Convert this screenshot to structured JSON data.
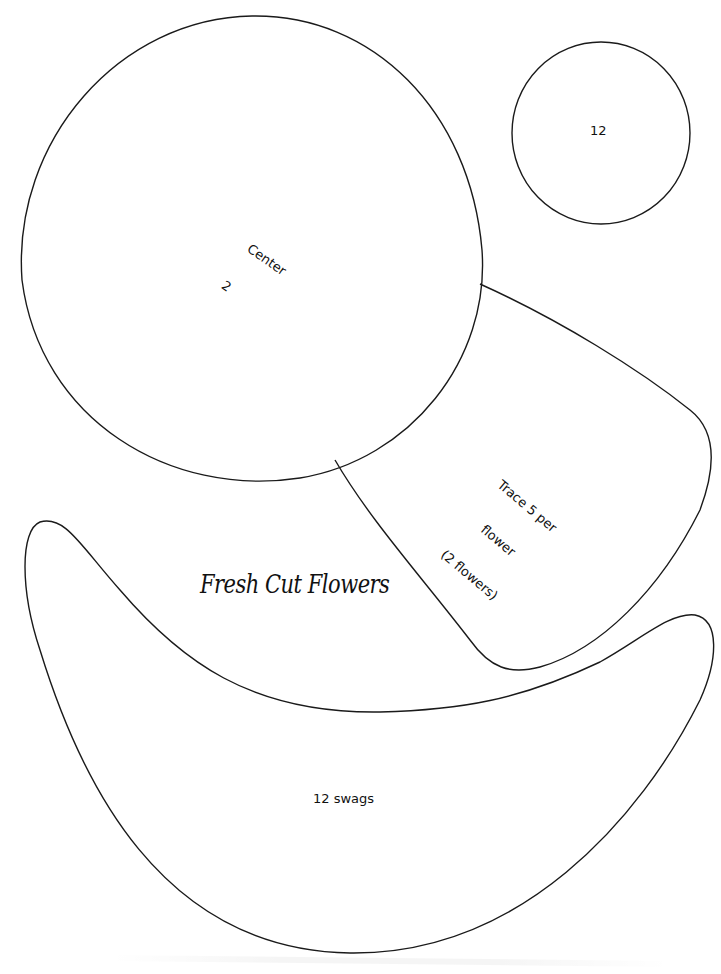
{
  "page": {
    "title": "Fresh Cut Flowers",
    "background": "#ffffff",
    "stroke_color": "#1a1a1a"
  },
  "pieces": {
    "center_circle": {
      "line1": "Center",
      "line2": "2"
    },
    "small_circle": {
      "label": "12"
    },
    "petal": {
      "line1": "Trace 5 per",
      "line2": "flower",
      "line3": "(2 flowers)"
    },
    "swag": {
      "label": "12 swags"
    }
  }
}
